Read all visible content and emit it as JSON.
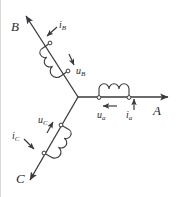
{
  "figure": {
    "type": "circuit-schematic",
    "width": 180,
    "height": 197,
    "background_color": "#ffffff",
    "line_color": "#3a3a3a",
    "text_color": "#2b2b2b"
  },
  "terminals": [
    {
      "id": "A",
      "label": "A",
      "direction": "right",
      "x": 160,
      "y": 97
    },
    {
      "id": "B",
      "label": "B",
      "direction": "upper-left",
      "x": 22,
      "y": 12
    },
    {
      "id": "C",
      "label": "C",
      "direction": "lower-left",
      "x": 22,
      "y": 182
    }
  ],
  "neutral_node": {
    "label": "",
    "x": 78,
    "y": 97
  },
  "branches": [
    {
      "phase": "a",
      "terminal": "A",
      "voltage_label": "u",
      "voltage_subscript": "a",
      "current_label": "i",
      "current_subscript": "a",
      "voltage_arrow_direction": "left",
      "current_arrow_direction": "up",
      "coil_side": "above",
      "coil_turns": 3
    },
    {
      "phase": "B",
      "terminal": "B",
      "voltage_label": "u",
      "voltage_subscript": "B",
      "current_label": "i",
      "current_subscript": "B",
      "voltage_arrow_direction": "down-right",
      "current_arrow_direction": "down-left",
      "coil_side": "left",
      "coil_turns": 3
    },
    {
      "phase": "C",
      "terminal": "C",
      "voltage_label": "u",
      "voltage_subscript": "C",
      "current_label": "i",
      "current_subscript": "C",
      "voltage_arrow_direction": "up-right",
      "current_arrow_direction": "down-left",
      "coil_side": "right",
      "coil_turns": 3
    }
  ],
  "labels": {
    "terminal_a": "A",
    "terminal_b": "B",
    "terminal_c": "C",
    "u_a_base": "u",
    "u_a_sub": "a",
    "i_a_base": "i",
    "i_a_sub": "a",
    "u_b_base": "u",
    "u_b_sub": "B",
    "i_b_base": "i",
    "i_b_sub": "B",
    "u_c_base": "u",
    "u_c_sub": "C",
    "i_c_base": "i",
    "i_c_sub": "C"
  }
}
